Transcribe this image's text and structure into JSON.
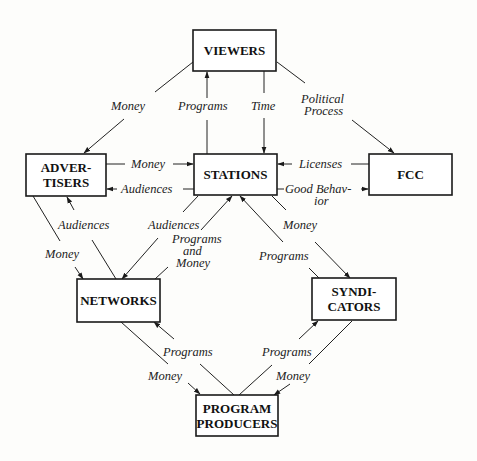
{
  "colors": {
    "ink": "#1a1a1a",
    "background": "#fdfdfb"
  },
  "nodes": {
    "viewers": {
      "lines": [
        "VIEWERS"
      ]
    },
    "stations": {
      "lines": [
        "STATIONS"
      ]
    },
    "advertisers": {
      "lines": [
        "ADVER-",
        "TISERS"
      ]
    },
    "fcc": {
      "lines": [
        "FCC"
      ]
    },
    "networks": {
      "lines": [
        "NETWORKS"
      ]
    },
    "syndicators": {
      "lines": [
        "SYNDI-",
        "CATORS"
      ]
    },
    "producers": {
      "lines": [
        "PROGRAM",
        "PRODUCERS"
      ]
    }
  },
  "edges": {
    "viewers_to_advertisers": {
      "from": "VIEWERS",
      "to": "ADVERTISERS",
      "label": "Money"
    },
    "stations_to_viewers": {
      "from": "STATIONS",
      "to": "VIEWERS",
      "label": "Programs"
    },
    "viewers_to_stations": {
      "from": "VIEWERS",
      "to": "STATIONS",
      "label": "Time"
    },
    "viewers_to_fcc": {
      "from": "VIEWERS",
      "to": "FCC",
      "label_lines": [
        "Political",
        "Process"
      ]
    },
    "advertisers_to_stations": {
      "from": "ADVERTISERS",
      "to": "STATIONS",
      "label": "Money"
    },
    "stations_to_advertisers": {
      "from": "STATIONS",
      "to": "ADVERTISERS",
      "label": "Audiences"
    },
    "fcc_to_stations": {
      "from": "FCC",
      "to": "STATIONS",
      "label": "Licenses"
    },
    "stations_to_fcc": {
      "from": "STATIONS",
      "to": "FCC",
      "label_lines": [
        "Good Behav-",
        "ior"
      ]
    },
    "networks_to_advertisers": {
      "from": "NETWORKS",
      "to": "ADVERTISERS",
      "label": "Audiences"
    },
    "advertisers_to_networks": {
      "from": "ADVERTISERS",
      "to": "NETWORKS",
      "label": "Money"
    },
    "stations_to_networks": {
      "from": "STATIONS",
      "to": "NETWORKS",
      "label": "Audiences"
    },
    "networks_to_stations": {
      "from": "NETWORKS",
      "to": "STATIONS",
      "label_lines": [
        "Programs",
        "and",
        "Money"
      ]
    },
    "stations_to_syndicators": {
      "from": "STATIONS",
      "to": "SYNDICATORS",
      "label": "Money"
    },
    "syndicators_to_stations": {
      "from": "SYNDICATORS",
      "to": "STATIONS",
      "label": "Programs"
    },
    "producers_to_networks": {
      "from": "PROGRAM PRODUCERS",
      "to": "NETWORKS",
      "label": "Programs"
    },
    "networks_to_producers": {
      "from": "NETWORKS",
      "to": "PROGRAM PRODUCERS",
      "label": "Money"
    },
    "producers_to_syndicators": {
      "from": "PROGRAM PRODUCERS",
      "to": "SYNDICATORS",
      "label": "Programs"
    },
    "syndicators_to_producers": {
      "from": "SYNDICATORS",
      "to": "PROGRAM PRODUCERS",
      "label": "Money"
    }
  }
}
